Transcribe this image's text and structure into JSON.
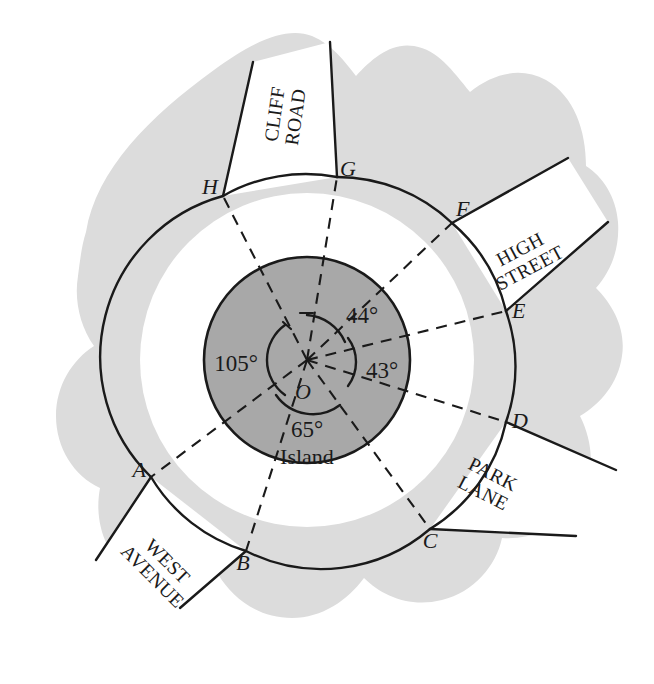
{
  "figure": {
    "type": "geometry-diagram",
    "center_label": "O",
    "island_label": "Island"
  },
  "colors": {
    "land": "#dcdcdc",
    "island": "#a8a8a8",
    "road": "#ffffff",
    "ink": "#1a1a1a"
  },
  "junction_points": [
    {
      "id": "A",
      "label": "A",
      "x": 151,
      "y": 477,
      "dir_deg": 208
    },
    {
      "id": "B",
      "label": "B",
      "x": 246,
      "y": 551,
      "dir_deg": 250
    },
    {
      "id": "C",
      "label": "C",
      "x": 430,
      "y": 529,
      "dir_deg": 290
    },
    {
      "id": "D",
      "label": "D",
      "x": 506,
      "y": 422,
      "dir_deg": 337
    },
    {
      "id": "E",
      "label": "E",
      "x": 506,
      "y": 311,
      "dir_deg": 20
    },
    {
      "id": "F",
      "label": "F",
      "x": 452,
      "y": 223,
      "dir_deg": 45
    },
    {
      "id": "G",
      "label": "G",
      "x": 337,
      "y": 177,
      "dir_deg": 80
    },
    {
      "id": "H",
      "label": "H",
      "x": 223,
      "y": 196,
      "dir_deg": 125
    }
  ],
  "roads": [
    {
      "id": "cliff-road",
      "lines": [
        "CLIFF",
        "ROAD"
      ],
      "x": 262,
      "y": 112,
      "rotate": -82,
      "between": [
        "H",
        "G"
      ]
    },
    {
      "id": "high-street",
      "lines": [
        "HIGH",
        "STREET"
      ],
      "x": 527,
      "y": 258,
      "rotate": -28,
      "between": [
        "F",
        "E"
      ]
    },
    {
      "id": "park-lane",
      "lines": [
        "PARK",
        "LANE"
      ],
      "x": 492,
      "y": 483,
      "rotate": 27,
      "between": [
        "D",
        "C"
      ]
    },
    {
      "id": "west-avenue",
      "lines": [
        "WEST",
        "AVENUE"
      ],
      "x": 165,
      "y": 570,
      "rotate": 45,
      "between": [
        "A",
        "B"
      ]
    }
  ],
  "angles": [
    {
      "id": "angle-105",
      "label": "105°",
      "value": 105,
      "unit": "deg",
      "x": 258,
      "y": 363
    },
    {
      "id": "angle-44",
      "label": "44°",
      "value": 44,
      "unit": "deg",
      "x": 344,
      "y": 315
    },
    {
      "id": "angle-43",
      "label": "43°",
      "value": 43,
      "unit": "deg",
      "x": 364,
      "y": 369
    },
    {
      "id": "angle-65",
      "label": "65°",
      "value": 65,
      "unit": "deg",
      "x": 307,
      "y": 428
    }
  ],
  "center_point": {
    "label": "O",
    "x": 303,
    "y": 392
  },
  "island_text": {
    "label": "Island",
    "x": 307,
    "y": 456
  }
}
